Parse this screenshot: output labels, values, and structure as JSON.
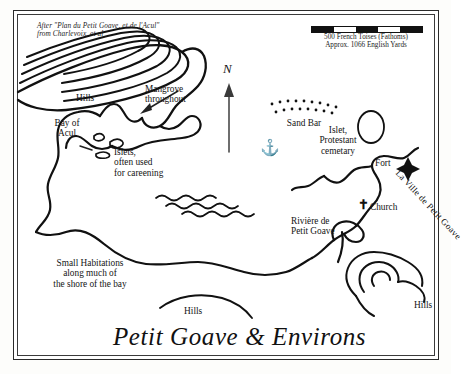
{
  "map": {
    "title": "Petit Goave & Environs",
    "credit_line1": "After \"Plan du Petit Goave, et de l'Acul\"",
    "credit_line2": "from Charlevoix, et al",
    "scale": {
      "caption_line1": "500 French Toises (Fathoms)",
      "caption_line2": "Approx. 1066 English Yards",
      "segments": [
        "black",
        "white",
        "black",
        "white",
        "black"
      ]
    },
    "compass": {
      "label": "N",
      "icon": "north-arrow-icon"
    },
    "labels": {
      "hills_nw": "Hills",
      "hills_south": "Hills",
      "hills_se": "Hills",
      "mangrove": "Mangrove\nthroughout",
      "mangrove_line1": "Mangrove",
      "mangrove_line2": "throughout",
      "bay_line1": "Bay of",
      "bay_line2": "Acul",
      "islets_line1": "Islets,",
      "islets_line2": "often used",
      "islets_line3": "for careening",
      "sand_bar": "Sand Bar",
      "islet_cem_line1": "Islet,",
      "islet_cem_line2": "Protestant",
      "islet_cem_line3": "cemetary",
      "fort": "Fort",
      "town": "La Ville de Petit Goave",
      "church": "Church",
      "river_line1": "Rivière de",
      "river_line2": "Petit Goave",
      "habitations_line1": "Small Habitations",
      "habitations_line2": "along much of",
      "habitations_line3": "the shore of the bay"
    },
    "symbols": {
      "anchor": "⚓",
      "church_cross": "✝",
      "fort_star": "fort-star-icon"
    },
    "colors": {
      "ink": "#111111",
      "paper": "#ffffff",
      "frame": "#2a2a2a"
    }
  }
}
